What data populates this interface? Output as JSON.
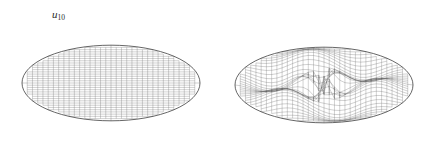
{
  "figure": {
    "width": 428,
    "height": 156,
    "background_color": "#ffffff",
    "line_color": "#555555",
    "outline_color": "#333333",
    "label_color": "#2b2b2b"
  },
  "panels": [
    {
      "id": "u10",
      "label_base": "u",
      "label_sub": "10",
      "domain_shape": "ellipse",
      "surface": "flat",
      "center_x": 111,
      "center_y": 83,
      "radius_x": 89,
      "radius_y": 61,
      "mesh_rows": 34,
      "mesh_cols": 34,
      "amplitude": 0
    },
    {
      "id": "u31",
      "label_base": "u",
      "label_sub": "31",
      "domain_shape": "ellipse",
      "surface": "wavy",
      "center_x": 110,
      "center_y": 85,
      "radius_x": 89,
      "radius_y": 61,
      "mesh_rows": 34,
      "mesh_cols": 34,
      "amplitude": 15,
      "mode_m": 3,
      "mode_n": 1
    }
  ],
  "chart_data": {
    "type": "surface-mesh",
    "title": "",
    "subtitle": "",
    "xlabel": "",
    "ylabel": "",
    "legend": [],
    "annotations": [
      "u10",
      "u31"
    ],
    "grid": true,
    "panel_count": 2,
    "series": [
      {
        "name": "u10",
        "description": "Elliptical membrane eigenmode plotted as a wireframe surface; surface appears flat/unperturbed at this scale.",
        "mode_indices": [
          1,
          0
        ],
        "amplitude": 0
      },
      {
        "name": "u31",
        "description": "Elliptical membrane eigenmode plotted as a wireframe surface; central S-shaped ridge and valley lobes visible.",
        "mode_indices": [
          3,
          1
        ],
        "amplitude": 15
      }
    ]
  }
}
